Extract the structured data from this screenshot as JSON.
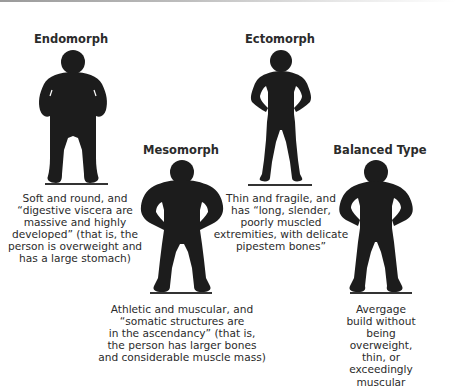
{
  "figure": {
    "types": [
      {
        "id": "endomorph",
        "title": "Endomorph",
        "description": "Soft and round, and\n“digestive viscera are\nmassive and highly\ndeveloped” (that is, the\nperson is overweight and\nhas a large stomach)"
      },
      {
        "id": "mesomorph",
        "title": "Mesomorph",
        "description": "Athletic and muscular, and\n“somatic structures are\nin the ascendancy” (that is,\nthe person has larger bones\nand considerable muscle mass)"
      },
      {
        "id": "ectomorph",
        "title": "Ectomorph",
        "description": "Thin and fragile, and\nhas “long, slender,\npoorly muscled\nextremities, with delicate\npipestem bones”"
      },
      {
        "id": "balanced",
        "title": "Balanced Type",
        "description": "Avergage build without\nbeing overweight, thin, or\nexceedingly muscular"
      }
    ],
    "colors": {
      "silhouette": "#1c1c1c",
      "text": "#2b2b2b",
      "background": "#ffffff"
    }
  }
}
